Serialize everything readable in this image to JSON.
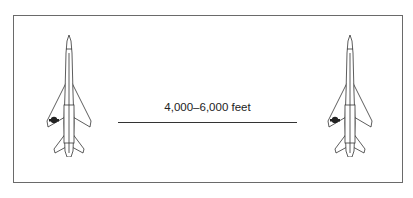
{
  "diagram": {
    "type": "aircraft-separation",
    "distance_label": "4,000–6,000 feet",
    "aircraft": [
      {
        "position": "left",
        "orientation": "nose-up",
        "insignia_wing": "left"
      },
      {
        "position": "right",
        "orientation": "nose-up",
        "insignia_wing": "left"
      }
    ],
    "colors": {
      "line": "#333333",
      "frame": "#6a6a6a",
      "text": "#222222"
    }
  }
}
